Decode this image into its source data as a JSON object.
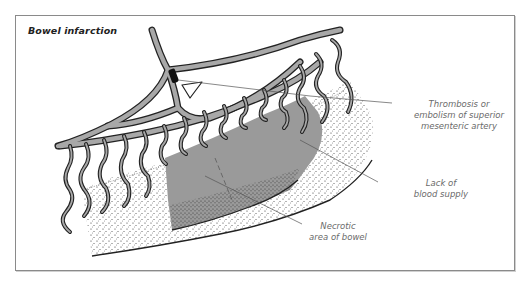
{
  "figure": {
    "title": "Bowel infarction",
    "colors": {
      "artery_fill": "#a8a8a8",
      "outline": "#222222",
      "necrotic_fill": "#9a9a9a",
      "occlusion": "#111111",
      "frame_border": "#8a8a8a",
      "label_text": "#6a6a6a",
      "leader_line": "#555555"
    }
  },
  "labels": {
    "thrombosis": {
      "lines": [
        "Thrombosis or",
        "embolism of superior",
        "mesenteric artery"
      ]
    },
    "blood_supply": {
      "lines": [
        "Lack of",
        "blood supply"
      ]
    },
    "necrotic": {
      "lines": [
        "Necrotic",
        "area of bowel"
      ]
    }
  }
}
